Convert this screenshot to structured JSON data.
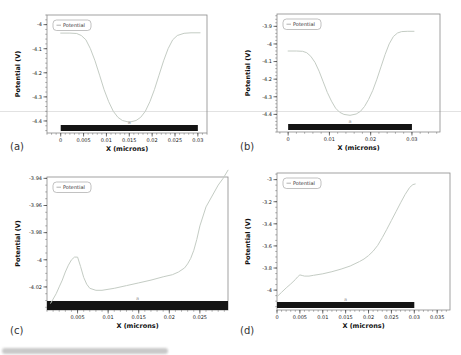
{
  "chart_data": [
    {
      "id": "a",
      "panel_label": "(a)",
      "type": "line",
      "xlabel": "X (microns)",
      "ylabel": "Potential (V)",
      "legend": [
        "Potential"
      ],
      "legend_position": "top-left",
      "grid": false,
      "xlim": [
        -0.003,
        0.032
      ],
      "ylim": [
        -4.45,
        -3.96
      ],
      "xticks": {
        "values": [
          0,
          0.005,
          0.01,
          0.015,
          0.02,
          0.025,
          0.03
        ],
        "labels": [
          "0",
          "0.005",
          "0.01",
          "0.015",
          "0.02",
          "0.025",
          "0.03"
        ],
        "minor_step": 0.001
      },
      "yticks": {
        "values": [
          -4.0,
          -4.1,
          -4.2,
          -4.3,
          -4.4
        ],
        "labels": [
          "-4",
          "-4.1",
          "-4.2",
          "-4.3",
          "-4.4"
        ],
        "minor_step": 0.02
      },
      "series": [
        {
          "name": "Potential",
          "color": "#c4ccc4",
          "x": [
            0,
            0.002,
            0.0035,
            0.0045,
            0.0055,
            0.0065,
            0.0075,
            0.0085,
            0.0095,
            0.0105,
            0.0115,
            0.0125,
            0.0135,
            0.015,
            0.0165,
            0.0175,
            0.0185,
            0.0195,
            0.0205,
            0.0215,
            0.0225,
            0.0235,
            0.0245,
            0.0255,
            0.027,
            0.0285,
            0.0305
          ],
          "y": [
            -4.035,
            -4.035,
            -4.037,
            -4.045,
            -4.063,
            -4.1,
            -4.15,
            -4.21,
            -4.27,
            -4.32,
            -4.36,
            -4.385,
            -4.398,
            -4.405,
            -4.398,
            -4.385,
            -4.36,
            -4.32,
            -4.27,
            -4.21,
            -4.15,
            -4.1,
            -4.063,
            -4.045,
            -4.036,
            -4.034,
            -4.034
          ]
        }
      ],
      "electrode_bar": {
        "x0": 0,
        "x1": 0.03,
        "color": "#141414"
      },
      "region_marker": {
        "x": 0.015,
        "label": "a",
        "color": "#9a9a9a"
      }
    },
    {
      "id": "b",
      "panel_label": "(b)",
      "type": "line",
      "xlabel": "X (microns)",
      "ylabel": "Potential (V)",
      "legend": [
        "Potential"
      ],
      "legend_position": "top-left",
      "grid": false,
      "xlim": [
        -0.0027,
        0.0368
      ],
      "ylim": [
        -4.5,
        -3.83
      ],
      "xticks": {
        "values": [
          0,
          0.01,
          0.02,
          0.03
        ],
        "labels": [
          "0",
          "0.01",
          "0.02",
          "0.03"
        ],
        "minor_step": 0.002
      },
      "yticks": {
        "values": [
          -3.9,
          -4.0,
          -4.1,
          -4.2,
          -4.3,
          -4.4
        ],
        "labels": [
          "-3.9",
          "-4",
          "-4.1",
          "-4.2",
          "-4.3",
          "-4.4"
        ],
        "minor_step": 0.02
      },
      "series": [
        {
          "name": "Potential",
          "color": "#c4ccc4",
          "x": [
            0,
            0.002,
            0.0035,
            0.0045,
            0.0055,
            0.0065,
            0.0075,
            0.0085,
            0.0095,
            0.0105,
            0.0115,
            0.0125,
            0.0135,
            0.015,
            0.0165,
            0.0175,
            0.0185,
            0.0195,
            0.0205,
            0.0215,
            0.0225,
            0.0235,
            0.0245,
            0.0255,
            0.0265,
            0.0275,
            0.029,
            0.0305
          ],
          "y": [
            -4.04,
            -4.04,
            -4.042,
            -4.05,
            -4.07,
            -4.105,
            -4.155,
            -4.215,
            -4.275,
            -4.325,
            -4.365,
            -4.388,
            -4.4,
            -4.405,
            -4.398,
            -4.383,
            -4.355,
            -4.315,
            -4.265,
            -4.2,
            -4.13,
            -4.06,
            -4.0,
            -3.958,
            -3.938,
            -3.93,
            -3.928,
            -3.928
          ]
        }
      ],
      "electrode_bar": {
        "x0": 0,
        "x1": 0.03,
        "color": "#141414"
      },
      "region_marker": {
        "x": 0.015,
        "label": "a",
        "color": "#9a9a9a"
      }
    },
    {
      "id": "c",
      "panel_label": "(c)",
      "type": "line",
      "xlabel": "X (microns)",
      "ylabel": "Potential (V)",
      "legend": [
        "Potential"
      ],
      "legend_position": "top-left",
      "grid": false,
      "xlim": [
        0,
        0.0296
      ],
      "ylim": [
        -4.037,
        -3.939
      ],
      "xticks": {
        "values": [
          0.005,
          0.01,
          0.015,
          0.02,
          0.025
        ],
        "labels": [
          "0.005",
          "0.01",
          "0.015",
          "0.02",
          "0.025"
        ],
        "minor_step": 0.001
      },
      "yticks": {
        "values": [
          -3.94,
          -3.96,
          -3.98,
          -4.0,
          -4.02
        ],
        "labels": [
          "-3.94",
          "-3.96",
          "-3.98",
          "-4",
          "-4.02"
        ],
        "minor_step": 0.005
      },
      "series": [
        {
          "name": "Potential",
          "color": "#c4ccc4",
          "x": [
            0.0006,
            0.001,
            0.0015,
            0.002,
            0.0025,
            0.003,
            0.0035,
            0.004,
            0.0045,
            0.005,
            0.0055,
            0.006,
            0.0065,
            0.007,
            0.008,
            0.009,
            0.011,
            0.013,
            0.015,
            0.017,
            0.019,
            0.0205,
            0.0215,
            0.0225,
            0.023,
            0.0235,
            0.024,
            0.0245,
            0.025,
            0.026,
            0.027,
            0.028,
            0.0288,
            0.0296
          ],
          "y": [
            -4.032,
            -4.029,
            -4.025,
            -4.02,
            -4.015,
            -4.009,
            -4.004,
            -4.0,
            -3.998,
            -3.998,
            -4.005,
            -4.013,
            -4.018,
            -4.021,
            -4.0225,
            -4.0225,
            -4.021,
            -4.019,
            -4.017,
            -4.015,
            -4.0125,
            -4.011,
            -4.009,
            -4.006,
            -4.003,
            -3.999,
            -3.993,
            -3.985,
            -3.975,
            -3.961,
            -3.953,
            -3.945,
            -3.94,
            -3.934
          ]
        }
      ],
      "electrode_bar": {
        "x0": 0,
        "x1": 0.0296,
        "color": "#141414"
      },
      "region_marker": {
        "x": 0.0148,
        "label": "a",
        "color": "#9a9a9a"
      }
    },
    {
      "id": "d",
      "panel_label": "(d)",
      "type": "line",
      "xlabel": "X (microns)",
      "ylabel": "Potential (V)",
      "legend": [
        "Potential"
      ],
      "legend_position": "top-left",
      "grid": false,
      "xlim": [
        0,
        0.0378
      ],
      "ylim": [
        -4.18,
        -2.94
      ],
      "xticks": {
        "values": [
          0,
          0.005,
          0.01,
          0.015,
          0.02,
          0.025,
          0.03,
          0.035
        ],
        "labels": [
          "0",
          "0.005",
          "0.01",
          "0.015",
          "0.02",
          "0.025",
          "0.03",
          "0.035"
        ],
        "minor_step": 0.001
      },
      "yticks": {
        "values": [
          -3.0,
          -3.2,
          -3.4,
          -3.6,
          -3.8,
          -4.0
        ],
        "labels": [
          "-3",
          "-3.2",
          "-3.4",
          "-3.6",
          "-3.8",
          "-4"
        ],
        "minor_step": 0.05
      },
      "series": [
        {
          "name": "Potential",
          "color": "#c4ccc4",
          "x": [
            0,
            0.001,
            0.002,
            0.003,
            0.004,
            0.0045,
            0.005,
            0.0055,
            0.006,
            0.007,
            0.008,
            0.01,
            0.012,
            0.014,
            0.016,
            0.018,
            0.019,
            0.02,
            0.021,
            0.022,
            0.023,
            0.024,
            0.025,
            0.026,
            0.027,
            0.028,
            0.029,
            0.0297,
            0.0302
          ],
          "y": [
            -4.06,
            -4.02,
            -3.98,
            -3.945,
            -3.905,
            -3.88,
            -3.862,
            -3.868,
            -3.873,
            -3.873,
            -3.866,
            -3.852,
            -3.833,
            -3.81,
            -3.782,
            -3.742,
            -3.718,
            -3.688,
            -3.648,
            -3.595,
            -3.525,
            -3.45,
            -3.37,
            -3.29,
            -3.21,
            -3.135,
            -3.07,
            -3.045,
            -3.04
          ]
        }
      ],
      "electrode_bar": {
        "x0": 0,
        "x1": 0.03,
        "color": "#141414"
      },
      "region_marker": {
        "x": 0.015,
        "label": "a",
        "color": "#9a9a9a"
      }
    }
  ]
}
